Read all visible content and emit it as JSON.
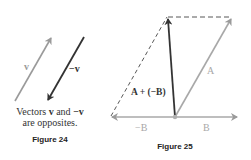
{
  "figure24": {
    "vector_v_label": "v",
    "vector_neg_v_label": "−v",
    "caption_line1_pre": "Vectors ",
    "caption_line1_v": "v",
    "caption_line1_mid": " and ",
    "caption_line1_negv": "−v",
    "caption_line2": "are opposites.",
    "title": "Figure 24",
    "colors": {
      "v": "#9a9a9a",
      "neg_v": "#333333"
    }
  },
  "figure25": {
    "label_A": "A",
    "label_sum": "A + (−B)",
    "label_B": "B",
    "label_neg_B": "−B",
    "title": "Figure 25",
    "colors": {
      "A": "#a8a8a8",
      "B": "#a8a8a8",
      "sum": "#333333",
      "dashed": "#444444"
    }
  }
}
